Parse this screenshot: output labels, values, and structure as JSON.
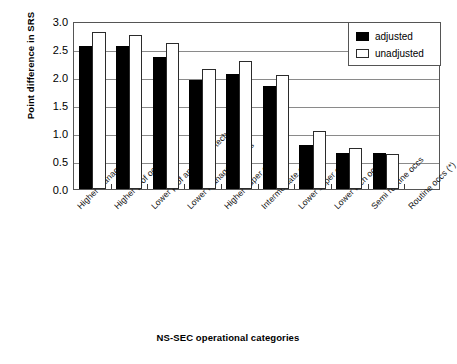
{
  "chart_data": {
    "type": "bar",
    "title": "",
    "xlabel": "NS-SEC operational categories",
    "ylabel": "Point difference in SRS",
    "ylim": [
      0,
      3.0
    ],
    "ytick_labels": [
      "0.0",
      "0.5",
      "1.0",
      "1.5",
      "2.0",
      "2.5",
      "3.0"
    ],
    "ytick_values": [
      0.0,
      0.5,
      1.0,
      1.5,
      2.0,
      2.5,
      3.0
    ],
    "grid": true,
    "legend_position": "top-right",
    "categories": [
      "Higher manag occs",
      "Higher prof occs",
      "Lower prof and higher tech occs",
      "Lower managerial occs",
      "Higher super occs",
      "Intermediate occs",
      "Lower super occs",
      "Lower tech occs",
      "Semi routine occs",
      "Routine occs (*)"
    ],
    "series": [
      {
        "name": "adjusted",
        "color": "#000000",
        "values": [
          2.55,
          2.55,
          2.35,
          1.95,
          2.05,
          1.84,
          0.79,
          0.64,
          0.64,
          0.0
        ]
      },
      {
        "name": "unadjusted",
        "color": "#ffffff",
        "values": [
          2.8,
          2.75,
          2.6,
          2.14,
          2.29,
          2.04,
          1.04,
          0.74,
          0.63,
          0.0
        ]
      }
    ]
  },
  "legend": {
    "items": [
      {
        "label": "adjusted",
        "swatch": "filled-black-swatch"
      },
      {
        "label": "unadjusted",
        "swatch": "outlined-white-swatch"
      }
    ]
  }
}
